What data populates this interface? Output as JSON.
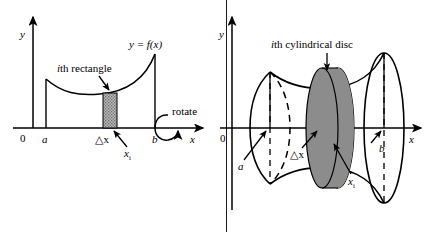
{
  "figure": {
    "panels": [
      {
        "id": "left",
        "name": "region-under-curve-with-ith-rectangle",
        "axes": {
          "y_label": "y",
          "x_label": "x",
          "origin_label": "0"
        },
        "labels": {
          "curve": "y = f(x)",
          "rectangle_callout_italic": "i",
          "rectangle_callout_rest": "th rectangle",
          "rectangle_callout_full": "ith rectangle",
          "left_bound": "a",
          "right_bound": "b",
          "width_label": "△x",
          "sample_point": "x",
          "sample_point_subscript": "i",
          "rotate": "rotate"
        }
      },
      {
        "id": "right",
        "name": "solid-of-revolution-with-ith-cylindrical-disc",
        "axes": {
          "y_label": "y",
          "x_label": "x",
          "origin_label": "0"
        },
        "labels": {
          "disc_callout_italic": "i",
          "disc_callout_rest": "th cylindrical disc",
          "disc_callout_full": "ith cylindrical disc",
          "left_bound": "a",
          "right_bound": "b",
          "width_label": "△x",
          "sample_point": "x",
          "sample_point_subscript": "i"
        }
      }
    ],
    "colors": {
      "background": "#ffffff",
      "ink": "#000000",
      "rectangle_fill": "#a8a8a8",
      "disc_near_face": "#8c8c8c",
      "disc_far_face": "#b0b0b0",
      "divider": "#1a1a1a"
    }
  }
}
